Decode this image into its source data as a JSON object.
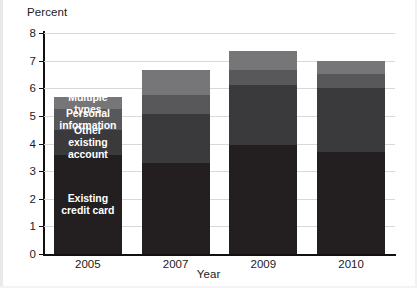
{
  "chart_data": {
    "type": "bar",
    "subtype": "stacked-bar",
    "title": "",
    "xlabel": "Year",
    "ylabel": "Percent",
    "categories": [
      "2005",
      "2007",
      "2009",
      "2010"
    ],
    "ylim": [
      0,
      8
    ],
    "yticks": [
      0,
      1,
      2,
      3,
      4,
      5,
      6,
      7,
      8
    ],
    "ytick_labels": [
      "0",
      "1",
      "2",
      "3",
      "4",
      "5",
      "6",
      "7",
      "8"
    ],
    "grid": true,
    "grid_axis": "y",
    "legend": "in-bar labels on 2005 column",
    "stack_order_bottom_to_top": [
      "Existing credit card",
      "Other existing account",
      "Personal information",
      "Multiple types"
    ],
    "series": [
      {
        "name": "Existing credit card",
        "color": "#231f20",
        "values": [
          3.6,
          3.3,
          3.95,
          3.7
        ]
      },
      {
        "name": "Other existing account",
        "color": "#3a3a3c",
        "values": [
          0.9,
          1.75,
          2.15,
          2.3
        ]
      },
      {
        "name": "Personal information",
        "color": "#58585b",
        "values": [
          0.75,
          0.7,
          0.55,
          0.5
        ]
      },
      {
        "name": "Multiple types",
        "color": "#767679",
        "values": [
          0.45,
          0.9,
          0.7,
          0.5
        ]
      }
    ],
    "totals": [
      5.7,
      6.65,
      7.35,
      7.0
    ]
  },
  "axis": {
    "y_title": "Percent",
    "x_title": "Year",
    "y_ticks": [
      "8",
      "7",
      "6",
      "5",
      "4",
      "3",
      "2",
      "1",
      "0"
    ],
    "x_ticks": [
      "2005",
      "2007",
      "2009",
      "2010"
    ]
  },
  "labels": {
    "multiple_types": "Multiple types",
    "personal_information_line1": "Personal",
    "personal_information_line2": "information",
    "other_existing_line1": "Other existing",
    "other_existing_line2": "account",
    "existing_credit_line1": "Existing",
    "existing_credit_line2": "credit card"
  },
  "colors": {
    "existing_credit_card": "#231f20",
    "other_existing_account": "#3a3a3c",
    "personal_information": "#58585b",
    "multiple_types": "#767679",
    "gridline": "#d8d8d8",
    "axis": "#111111",
    "text": "#1b1b1b",
    "label_text": "#ffffff",
    "background": "#ffffff"
  }
}
